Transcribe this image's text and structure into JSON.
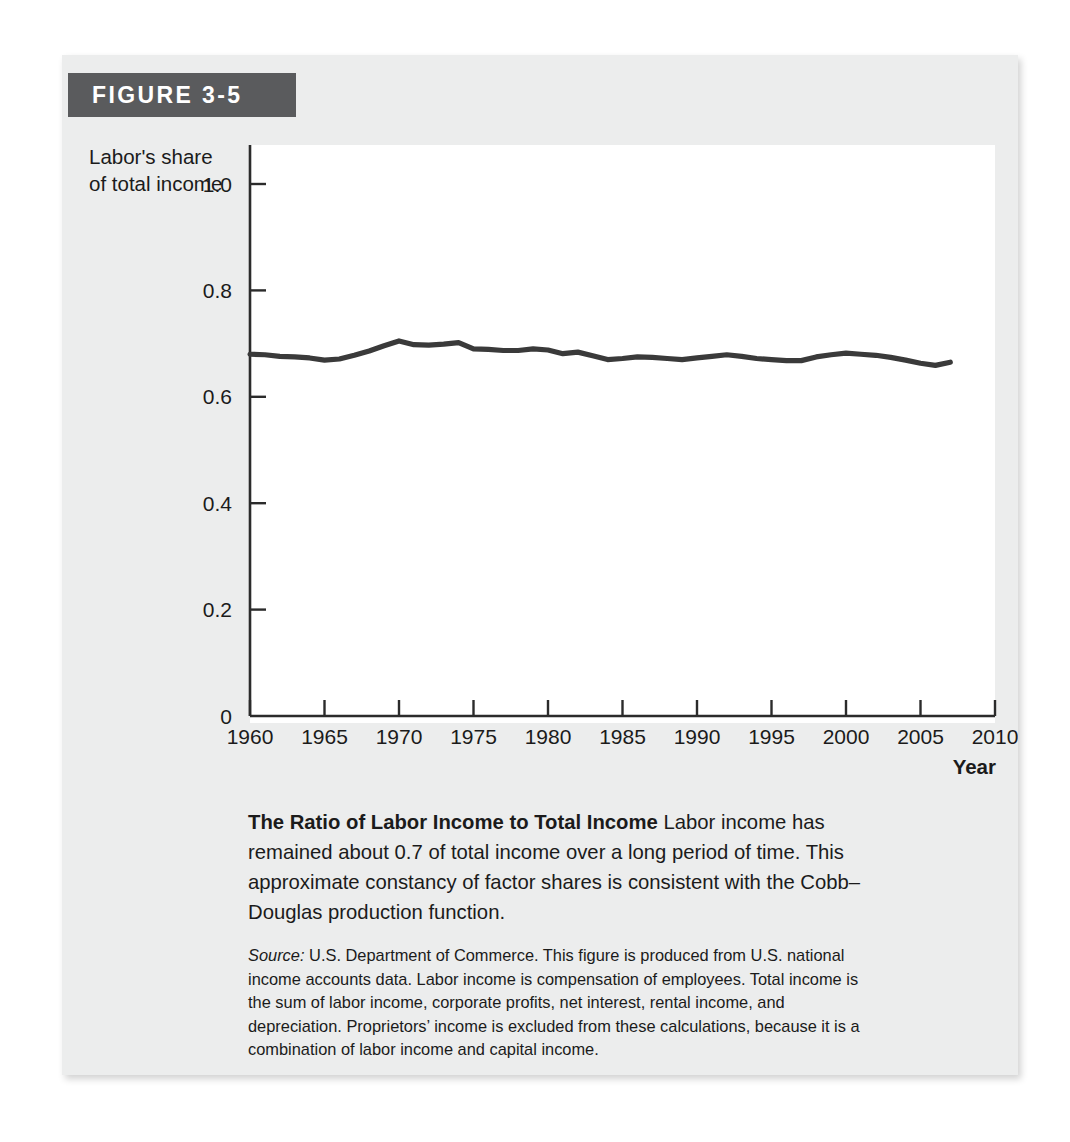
{
  "figure": {
    "number_label": "FIGURE 3-5",
    "header_bg": "#5a5b5d",
    "panel_bg": "#eceded"
  },
  "chart_data": {
    "type": "line",
    "title": "The Ratio of Labor Income to Total Income",
    "xlabel": "Year",
    "ylabel": "Labor's share of total income",
    "ylabel_line1": "Labor's share",
    "ylabel_line2": "of total income",
    "xlim": [
      1960,
      2010
    ],
    "ylim": [
      0,
      1.0
    ],
    "grid": false,
    "legend": "none",
    "line_color": "#3a3a3a",
    "xticks": [
      1960,
      1965,
      1970,
      1975,
      1980,
      1985,
      1990,
      1995,
      2000,
      2005,
      2010
    ],
    "xtick_labels": [
      "1960",
      "1965",
      "1970",
      "1975",
      "1980",
      "1985",
      "1990",
      "1995",
      "2000",
      "2005",
      "2010"
    ],
    "yticks": [
      0,
      0.2,
      0.4,
      0.6,
      0.8,
      1.0
    ],
    "ytick_labels": [
      "0",
      "0.2",
      "0.4",
      "0.6",
      "0.8",
      "1.0"
    ],
    "x": [
      1960,
      1961,
      1962,
      1963,
      1964,
      1965,
      1966,
      1967,
      1968,
      1969,
      1970,
      1971,
      1972,
      1973,
      1974,
      1975,
      1976,
      1977,
      1978,
      1979,
      1980,
      1981,
      1982,
      1983,
      1984,
      1985,
      1986,
      1987,
      1988,
      1989,
      1990,
      1991,
      1992,
      1993,
      1994,
      1995,
      1996,
      1997,
      1998,
      1999,
      2000,
      2001,
      2002,
      2003,
      2004,
      2005,
      2006,
      2007
    ],
    "values": [
      0.68,
      0.679,
      0.676,
      0.675,
      0.673,
      0.669,
      0.671,
      0.678,
      0.686,
      0.696,
      0.705,
      0.698,
      0.697,
      0.699,
      0.702,
      0.69,
      0.689,
      0.687,
      0.687,
      0.69,
      0.688,
      0.681,
      0.684,
      0.677,
      0.67,
      0.672,
      0.675,
      0.674,
      0.672,
      0.67,
      0.673,
      0.676,
      0.679,
      0.676,
      0.672,
      0.67,
      0.668,
      0.668,
      0.675,
      0.679,
      0.682,
      0.68,
      0.678,
      0.674,
      0.669,
      0.663,
      0.659,
      0.665
    ],
    "series_name": "Labor's share of total income"
  },
  "caption": {
    "title": "The Ratio of Labor Income to Total Income",
    "body": " Labor income has remained about 0.7 of total income over a long period of time. This approximate constancy of factor shares is consistent with the Cobb–Douglas production function."
  },
  "source": {
    "label": "Source:",
    "text": " U.S. Department of Commerce. This figure is produced from U.S. national income accounts data. Labor income is compensation of employees. Total income is the sum of labor income, corporate profits, net interest, rental income, and depreciation. Proprietors’ income is excluded from these calculations, because it is a combination of labor income and capital income."
  }
}
